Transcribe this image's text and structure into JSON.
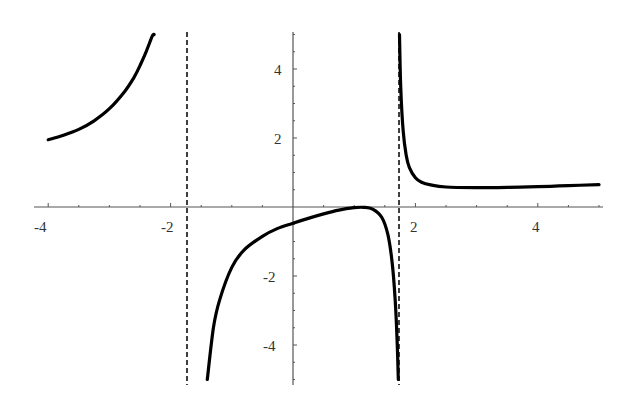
{
  "chart_data": {
    "type": "line",
    "title": "",
    "xlabel": "",
    "ylabel": "",
    "xlim": [
      -4.2,
      5.1
    ],
    "ylim": [
      -5,
      5
    ],
    "grid": false,
    "legend": null,
    "x_ticks": [
      -4,
      -2,
      2,
      4
    ],
    "x_tick_labels": [
      "-4",
      "-2",
      "2",
      "4"
    ],
    "y_ticks": [
      -4,
      -2,
      2,
      4
    ],
    "y_tick_labels": [
      "-4",
      "-2",
      "2",
      "4"
    ],
    "asymptotes": [
      {
        "type": "vertical",
        "x": -1.732,
        "style": "dashed"
      },
      {
        "type": "vertical",
        "x": 1.732,
        "style": "dashed"
      }
    ],
    "series": [
      {
        "name": "left-branch",
        "x": [
          -4.0,
          -3.75,
          -3.5,
          -3.25,
          -3.0,
          -2.75,
          -2.6,
          -2.5,
          -2.4,
          -2.3,
          -2.27
        ],
        "y": [
          1.95,
          2.08,
          2.25,
          2.5,
          2.85,
          3.35,
          3.75,
          4.1,
          4.5,
          4.95,
          5.0
        ]
      },
      {
        "name": "middle-branch",
        "x": [
          -1.4,
          -1.3,
          -1.2,
          -1.0,
          -0.8,
          -0.5,
          -0.25,
          0.0,
          0.25,
          0.5,
          0.75,
          1.0,
          1.15,
          1.3,
          1.45,
          1.55,
          1.62,
          1.67,
          1.7,
          1.72
        ],
        "y": [
          -5.0,
          -3.5,
          -2.7,
          -1.75,
          -1.25,
          -0.85,
          -0.62,
          -0.47,
          -0.33,
          -0.2,
          -0.09,
          -0.02,
          -0.01,
          -0.06,
          -0.3,
          -0.8,
          -1.6,
          -2.7,
          -3.8,
          -5.0
        ]
      },
      {
        "name": "right-branch",
        "x": [
          1.74,
          1.76,
          1.8,
          1.85,
          1.9,
          2.0,
          2.1,
          2.25,
          2.5,
          3.0,
          3.5,
          4.0,
          4.5,
          5.0
        ],
        "y": [
          5.0,
          3.5,
          2.2,
          1.5,
          1.15,
          0.85,
          0.72,
          0.64,
          0.58,
          0.56,
          0.57,
          0.59,
          0.62,
          0.65
        ]
      }
    ]
  },
  "axes": {
    "x_labels": [
      {
        "text": "-4",
        "value": -4
      },
      {
        "text": "-2",
        "value": -2
      },
      {
        "text": "2",
        "value": 2
      },
      {
        "text": "4",
        "value": 4
      }
    ],
    "y_labels": [
      {
        "text": "4",
        "value": 4
      },
      {
        "text": "2",
        "value": 2
      },
      {
        "text": "-2",
        "value": -2
      },
      {
        "text": "-4",
        "value": -4
      }
    ]
  },
  "colors": {
    "curve": "#000000",
    "axis": "#444444",
    "asymptote": "#111111",
    "background": "#ffffff"
  }
}
